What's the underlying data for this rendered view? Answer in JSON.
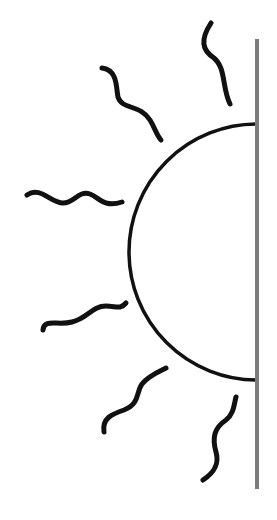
{
  "figure": {
    "description": "Line drawing of a half sun rising from behind a vertical wall, with six wavy rays",
    "background": "#ffffff",
    "wall": {
      "x": 257,
      "y1": 39,
      "y2": 489,
      "width": 4,
      "color": "#7d7d7d"
    },
    "sun": {
      "shape": "half-circle",
      "center_x": 257,
      "center_y": 252,
      "radius": 128,
      "stroke_width": 3.5,
      "color": "#111111"
    },
    "rays": [
      {
        "name": "ray-top-right",
        "path": "M211,23 C200,40 202,50 214,58 C226,68 222,88 230,104"
      },
      {
        "name": "ray-upper-left",
        "path": "M102,68 C118,70 116,88 118,97 C122,110 140,104 150,120 C155,128 156,134 161,140"
      },
      {
        "name": "ray-left-upper",
        "path": "M27,195 C40,186 50,202 62,203 C74,204 78,190 90,194 C100,198 104,208 122,202"
      },
      {
        "name": "ray-left-lower",
        "path": "M43,330 C44,318 58,326 72,322 C88,318 92,306 106,306 C116,306 120,310 126,303"
      },
      {
        "name": "ray-lower-left",
        "path": "M104,432 C102,418 112,414 124,410 C140,404 136,392 142,384 C148,376 158,372 166,368"
      },
      {
        "name": "ray-bottom-right",
        "path": "M203,480 C212,474 220,466 216,452 C212,438 214,428 226,420 C234,414 234,404 236,397"
      }
    ],
    "ray_color": "#111111",
    "ray_width": 5
  }
}
